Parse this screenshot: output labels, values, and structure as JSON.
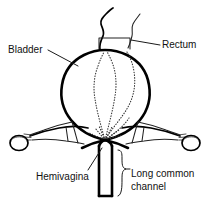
{
  "figure": {
    "kind": "medical-anatomy-line-drawing",
    "background_color": "#ffffff",
    "line_color": "#000000",
    "text_color": "#111111"
  },
  "labels": {
    "bladder": "Bladder",
    "rectum": "Rectum",
    "hemivagina": "Hemivagina",
    "long_common_channel_line1": "Long common",
    "long_common_channel_line2": "channel"
  },
  "structures": [
    {
      "name": "bladder",
      "description": "large distended balloon-shaped bladder, thick outline"
    },
    {
      "name": "rectum",
      "description": "two wavy tubes emerging from top of bladder"
    },
    {
      "name": "hemivagina-left",
      "description": "dotted internal hemivagina outline, left"
    },
    {
      "name": "hemivagina-right",
      "description": "dotted internal hemivagina outline, right"
    },
    {
      "name": "fallopian-tube-left",
      "description": "left horn with ovary at distal end"
    },
    {
      "name": "fallopian-tube-right",
      "description": "right horn with ovary at distal end"
    },
    {
      "name": "ovary-left",
      "description": "oval at distal left"
    },
    {
      "name": "ovary-right",
      "description": "oval at distal right"
    },
    {
      "name": "common-channel",
      "description": "vertical double-line tube descending from confluence"
    },
    {
      "name": "brace",
      "description": "curly brace marking extent of common channel"
    }
  ]
}
